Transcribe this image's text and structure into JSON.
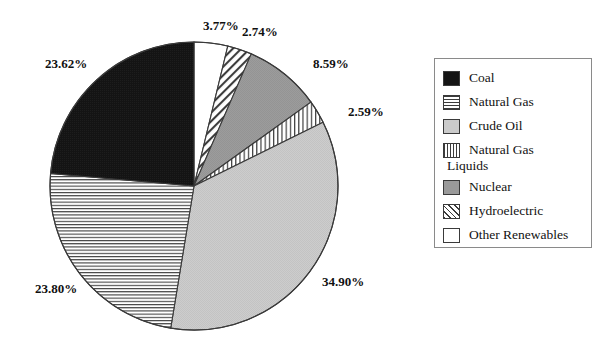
{
  "chart_data": {
    "type": "pie",
    "title": "",
    "subtitle": "",
    "xlabel": "",
    "ylabel": "",
    "legend_position": "right",
    "grid": false,
    "labels_format": "percent",
    "categories": [
      "Coal",
      "Natural Gas",
      "Crude Oil",
      "Natural Gas Liquids",
      "Nuclear",
      "Hydroelectric",
      "Other Renewables"
    ],
    "values": [
      23.62,
      23.8,
      34.9,
      2.59,
      8.59,
      2.74,
      3.77
    ],
    "value_labels": [
      "23.62%",
      "23.80%",
      "34.90%",
      "2.59%",
      "8.59%",
      "2.74%",
      "3.77%"
    ],
    "slices": [
      {
        "label": "Other Renewables",
        "value": 3.77,
        "value_label": "3.77%",
        "fill": "white",
        "color": "#ffffff",
        "order_from_top_clockwise": 1
      },
      {
        "label": "Hydroelectric",
        "value": 2.74,
        "value_label": "2.74%",
        "fill": "diagonal-hatch",
        "color": "#3c3c3c",
        "order_from_top_clockwise": 2
      },
      {
        "label": "Nuclear",
        "value": 8.59,
        "value_label": "8.59%",
        "fill": "solid-medium-gray",
        "color": "#9a9a9a",
        "order_from_top_clockwise": 3
      },
      {
        "label": "Natural Gas Liquids",
        "value": 2.59,
        "value_label": "2.59%",
        "fill": "vertical-lines",
        "color": "#3c3c3c",
        "order_from_top_clockwise": 4
      },
      {
        "label": "Crude Oil",
        "value": 34.9,
        "value_label": "34.90%",
        "fill": "solid-light-gray",
        "color": "#cbcbcb",
        "order_from_top_clockwise": 5
      },
      {
        "label": "Natural Gas",
        "value": 23.8,
        "value_label": "23.80%",
        "fill": "horizontal-lines",
        "color": "#3c3c3c",
        "order_from_top_clockwise": 6
      },
      {
        "label": "Coal",
        "value": 23.62,
        "value_label": "23.62%",
        "fill": "solid-black",
        "color": "#151515",
        "order_from_top_clockwise": 7
      }
    ]
  },
  "pct_labels": [
    {
      "text": "3.77%",
      "left": 203,
      "top": 18
    },
    {
      "text": "2.74%",
      "left": 242,
      "top": 24
    },
    {
      "text": "8.59%",
      "left": 313,
      "top": 56
    },
    {
      "text": "2.59%",
      "left": 348,
      "top": 104
    },
    {
      "text": "34.90%",
      "left": 322,
      "top": 274
    },
    {
      "text": "23.80%",
      "left": 35,
      "top": 281
    },
    {
      "text": "23.62%",
      "left": 45,
      "top": 56
    }
  ],
  "legend": {
    "items": [
      {
        "label": "Coal",
        "swatch": "solid-black",
        "swatch_class": "sw-solid-black"
      },
      {
        "label": "Natural Gas",
        "swatch": "horizontal-lines",
        "swatch_class": "sw-hlines"
      },
      {
        "label": "Crude Oil",
        "swatch": "solid-light-gray",
        "swatch_class": "sw-lightgray"
      },
      {
        "label": "Natural Gas",
        "swatch": "vertical-lines",
        "swatch_class": "sw-vlines",
        "continued": "Liquids"
      },
      {
        "label": "Nuclear",
        "swatch": "solid-medium-gray",
        "swatch_class": "sw-midgray"
      },
      {
        "label": "Hydroelectric",
        "swatch": "diagonal-hatch",
        "swatch_class": "sw-diag"
      },
      {
        "label": "Other Renewables",
        "swatch": "white",
        "swatch_class": "sw-white"
      }
    ]
  }
}
